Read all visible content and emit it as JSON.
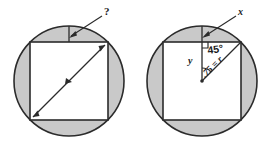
{
  "figure": {
    "background_color": "#ffffff",
    "stroke_color": "#2b2b2b",
    "shade_color": "#c9c9c9",
    "square_fill": "#ffffff"
  },
  "left_figure": {
    "name": "circle-with-inscribed-square-unknown",
    "circle": {
      "cx": 69,
      "cy": 81,
      "r": 55
    },
    "square": {
      "x": 30,
      "y": 42,
      "size": 78
    },
    "labels": {
      "unknown": "?"
    },
    "annotations": {
      "diagonal_arrow": "double-headed diagonal arrow across square",
      "gap_segment": "vertical segment from square top edge to circle top"
    }
  },
  "right_figure": {
    "name": "circle-with-inscribed-square-solved",
    "circle": {
      "cx": 202,
      "cy": 81,
      "r": 55
    },
    "square": {
      "x": 163,
      "y": 42,
      "size": 78
    },
    "labels": {
      "x": "x",
      "y": "y",
      "angle": "45°",
      "radius": ".75 = r"
    },
    "annotations": {
      "right_angle_marker": "right angle square at top of y segment",
      "center_dot": "center point of circle",
      "angle_arc": "arc marking 45 degree angle at center"
    }
  }
}
